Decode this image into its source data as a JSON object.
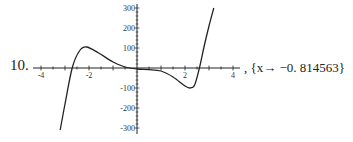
{
  "problem_number": "10.",
  "result_text": ", {x→ −0. 814563}",
  "chart_data": {
    "type": "line",
    "title": "",
    "xlabel": "",
    "ylabel": "",
    "xlim": [
      -4,
      4
    ],
    "ylim": [
      -300,
      300
    ],
    "x_ticks": [
      "-4",
      "-2",
      "2",
      "4"
    ],
    "y_ticks": [
      "300",
      "200",
      "100",
      "-100",
      "-200",
      "-300"
    ],
    "grid": false,
    "series": [
      {
        "name": "f(x)",
        "x": [
          -3.2,
          -3.0,
          -2.7,
          -2.4,
          -2.1,
          -1.6,
          -1.0,
          -0.5,
          0.0,
          0.5,
          1.0,
          1.5,
          2.0,
          2.2,
          2.4,
          2.6,
          2.8,
          3.0,
          3.2
        ],
        "y": [
          -310,
          -180,
          0,
          85,
          105,
          75,
          30,
          5,
          -5,
          -8,
          -15,
          -45,
          -90,
          -100,
          -85,
          0,
          110,
          210,
          300
        ]
      }
    ],
    "annotations": [
      "{x -> -0.814563}"
    ]
  }
}
